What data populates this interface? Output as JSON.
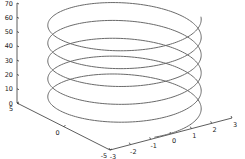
{
  "chart_data": {
    "type": "line",
    "subtype": "3d-line",
    "title": "",
    "xlabel": "",
    "ylabel": "",
    "zlabel": "",
    "x_ticks": [
      -3,
      -2,
      -1,
      0,
      1,
      2,
      3
    ],
    "y_ticks": [
      -5,
      0,
      5
    ],
    "z_ticks": [
      0,
      10,
      20,
      30,
      40,
      50,
      60,
      70
    ],
    "xlim": [
      -3,
      3
    ],
    "ylim": [
      -5,
      5
    ],
    "zlim": [
      0,
      70
    ],
    "grid": false,
    "legend": null,
    "series": [
      {
        "name": "helix",
        "equation": "x = 3*sin(t), y = 5*cos(t), z = t",
        "t_range": [
          0,
          65
        ],
        "turns": 5.2,
        "color": "#6a6a6a"
      }
    ]
  },
  "axes": {
    "z_labels": [
      "0",
      "10",
      "20",
      "30",
      "40",
      "50",
      "60",
      "70"
    ],
    "x_labels": [
      "-3",
      "-2",
      "-1",
      "0",
      "1",
      "2",
      "3"
    ],
    "y_labels": [
      "-5",
      "0",
      "5"
    ]
  },
  "colors": {
    "background": "#ffffff",
    "axis": "#333333",
    "line": "#6a6a6a"
  }
}
